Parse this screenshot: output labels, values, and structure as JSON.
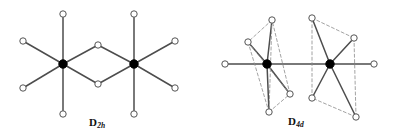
{
  "figure": {
    "type": "diagram",
    "background_color": "#ffffff",
    "bond_color": "#4d4d4d",
    "dashed_color": "#8c8c8c",
    "vertex_stroke_color": "#555555",
    "vertex_fill_color": "#ffffff",
    "metal_fill_color": "#000000",
    "width": 398,
    "height": 140
  },
  "structures": [
    {
      "id": "d2h",
      "label_main": "D",
      "label_sub": "2h",
      "description": "edge-sharing bioctahedron, two metal centers bridged by two atoms",
      "metal_centers": [
        {
          "name": "metal-left",
          "x": 63,
          "y": 64,
          "r": 4.2
        },
        {
          "name": "metal-right",
          "x": 134,
          "y": 64,
          "r": 4.2
        }
      ],
      "ligands": [
        {
          "name": "ligand-l-up",
          "x": 63,
          "y": 14,
          "r": 3.2
        },
        {
          "name": "ligand-l-down",
          "x": 63,
          "y": 114,
          "r": 3.2
        },
        {
          "name": "ligand-l-upleft",
          "x": 23,
          "y": 41,
          "r": 3.2
        },
        {
          "name": "ligand-l-downleft",
          "x": 23,
          "y": 88,
          "r": 3.2
        },
        {
          "name": "ligand-r-up",
          "x": 134,
          "y": 14,
          "r": 3.2
        },
        {
          "name": "ligand-r-down",
          "x": 134,
          "y": 114,
          "r": 3.2
        },
        {
          "name": "ligand-r-upright",
          "x": 175,
          "y": 41,
          "r": 3.2
        },
        {
          "name": "ligand-r-downright",
          "x": 175,
          "y": 88,
          "r": 3.2
        },
        {
          "name": "bridge-top",
          "x": 98,
          "y": 45,
          "r": 3.2
        },
        {
          "name": "bridge-bottom",
          "x": 98,
          "y": 84,
          "r": 3.2
        }
      ],
      "bonds": [
        {
          "from": [
            63,
            64
          ],
          "to": [
            63,
            14
          ],
          "style": "solid"
        },
        {
          "from": [
            63,
            64
          ],
          "to": [
            63,
            114
          ],
          "style": "solid"
        },
        {
          "from": [
            63,
            64
          ],
          "to": [
            23,
            41
          ],
          "style": "solid"
        },
        {
          "from": [
            63,
            64
          ],
          "to": [
            23,
            88
          ],
          "style": "solid"
        },
        {
          "from": [
            63,
            64
          ],
          "to": [
            98,
            45
          ],
          "style": "solid"
        },
        {
          "from": [
            63,
            64
          ],
          "to": [
            98,
            84
          ],
          "style": "solid"
        },
        {
          "from": [
            134,
            64
          ],
          "to": [
            134,
            14
          ],
          "style": "solid"
        },
        {
          "from": [
            134,
            64
          ],
          "to": [
            134,
            114
          ],
          "style": "solid"
        },
        {
          "from": [
            134,
            64
          ],
          "to": [
            175,
            41
          ],
          "style": "solid"
        },
        {
          "from": [
            134,
            64
          ],
          "to": [
            175,
            88
          ],
          "style": "solid"
        },
        {
          "from": [
            134,
            64
          ],
          "to": [
            98,
            45
          ],
          "style": "solid"
        },
        {
          "from": [
            134,
            64
          ],
          "to": [
            98,
            84
          ],
          "style": "solid"
        }
      ]
    },
    {
      "id": "d4d",
      "label_main": "D",
      "label_sub": "4d",
      "description": "two square-antiprismatic metal centers on a shared linear axis with terminal atoms",
      "metal_centers": [
        {
          "name": "metal-left",
          "x": 267,
          "y": 64,
          "r": 4.2
        },
        {
          "name": "metal-right",
          "x": 330,
          "y": 64,
          "r": 4.2
        }
      ],
      "ligands": [
        {
          "name": "terminal-left",
          "x": 225,
          "y": 64,
          "r": 3.2
        },
        {
          "name": "terminal-right",
          "x": 374,
          "y": 64,
          "r": 3.2
        },
        {
          "name": "ligand-la-top",
          "x": 272,
          "y": 20,
          "r": 3.2
        },
        {
          "name": "ligand-la-upper",
          "x": 248,
          "y": 42,
          "r": 3.2
        },
        {
          "name": "ligand-la-lower",
          "x": 290,
          "y": 94,
          "r": 3.2
        },
        {
          "name": "ligand-la-bottom",
          "x": 269,
          "y": 112,
          "r": 3.2
        },
        {
          "name": "ligand-rb-top",
          "x": 312,
          "y": 18,
          "r": 3.2
        },
        {
          "name": "ligand-rb-upper",
          "x": 354,
          "y": 38,
          "r": 3.2
        },
        {
          "name": "ligand-rb-lower",
          "x": 312,
          "y": 98,
          "r": 3.2
        },
        {
          "name": "ligand-rb-bottom",
          "x": 356,
          "y": 117,
          "r": 3.2
        }
      ],
      "bonds": [
        {
          "from": [
            267,
            64
          ],
          "to": [
            225,
            64
          ],
          "style": "solid"
        },
        {
          "from": [
            267,
            64
          ],
          "to": [
            330,
            64
          ],
          "style": "solid"
        },
        {
          "from": [
            330,
            64
          ],
          "to": [
            374,
            64
          ],
          "style": "solid"
        },
        {
          "from": [
            267,
            64
          ],
          "to": [
            272,
            20
          ],
          "style": "solid"
        },
        {
          "from": [
            267,
            64
          ],
          "to": [
            248,
            42
          ],
          "style": "solid"
        },
        {
          "from": [
            267,
            64
          ],
          "to": [
            290,
            94
          ],
          "style": "solid"
        },
        {
          "from": [
            267,
            64
          ],
          "to": [
            269,
            112
          ],
          "style": "solid"
        },
        {
          "from": [
            330,
            64
          ],
          "to": [
            312,
            18
          ],
          "style": "solid"
        },
        {
          "from": [
            330,
            64
          ],
          "to": [
            354,
            38
          ],
          "style": "solid"
        },
        {
          "from": [
            330,
            64
          ],
          "to": [
            312,
            98
          ],
          "style": "solid"
        },
        {
          "from": [
            330,
            64
          ],
          "to": [
            356,
            117
          ],
          "style": "solid"
        },
        {
          "from": [
            272,
            20
          ],
          "to": [
            248,
            42
          ],
          "style": "dashed"
        },
        {
          "from": [
            248,
            42
          ],
          "to": [
            269,
            112
          ],
          "style": "dashed"
        },
        {
          "from": [
            269,
            112
          ],
          "to": [
            290,
            94
          ],
          "style": "dashed"
        },
        {
          "from": [
            290,
            94
          ],
          "to": [
            272,
            20
          ],
          "style": "dashed"
        },
        {
          "from": [
            272,
            20
          ],
          "to": [
            269,
            112
          ],
          "style": "dashed"
        },
        {
          "from": [
            248,
            42
          ],
          "to": [
            290,
            94
          ],
          "style": "dashed"
        },
        {
          "from": [
            312,
            18
          ],
          "to": [
            354,
            38
          ],
          "style": "dashed"
        },
        {
          "from": [
            354,
            38
          ],
          "to": [
            356,
            117
          ],
          "style": "dashed"
        },
        {
          "from": [
            356,
            117
          ],
          "to": [
            312,
            98
          ],
          "style": "dashed"
        },
        {
          "from": [
            312,
            98
          ],
          "to": [
            312,
            18
          ],
          "style": "dashed"
        }
      ]
    }
  ]
}
